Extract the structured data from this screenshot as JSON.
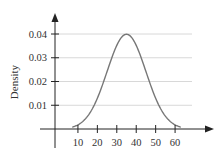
{
  "chart_data": {
    "type": "line",
    "title": "",
    "xlabel": "",
    "ylabel": "Density",
    "x_ticks": [
      10,
      20,
      30,
      40,
      50,
      60
    ],
    "y_ticks": [
      0.01,
      0.02,
      0.03,
      0.04
    ],
    "y_tick_labels": [
      "0.01",
      "0.02",
      "0.03",
      "0.04"
    ],
    "xlim": [
      -5,
      75
    ],
    "ylim": [
      0,
      0.047
    ],
    "grid": "horizontal",
    "legend": null,
    "series": [
      {
        "name": "Normal density (mean 35, sd 10)",
        "distribution": {
          "mean": 35,
          "sd": 10
        },
        "x": [
          5,
          10,
          15,
          20,
          25,
          30,
          35,
          40,
          45,
          50,
          55,
          60,
          65
        ],
        "y": [
          0.0002,
          0.0018,
          0.0054,
          0.013,
          0.0242,
          0.0352,
          0.0399,
          0.0352,
          0.0242,
          0.013,
          0.0054,
          0.0018,
          0.0002
        ]
      }
    ],
    "colors": {
      "curve": "#777777",
      "grid": "#d8d8d8",
      "axis": "#222222"
    }
  }
}
